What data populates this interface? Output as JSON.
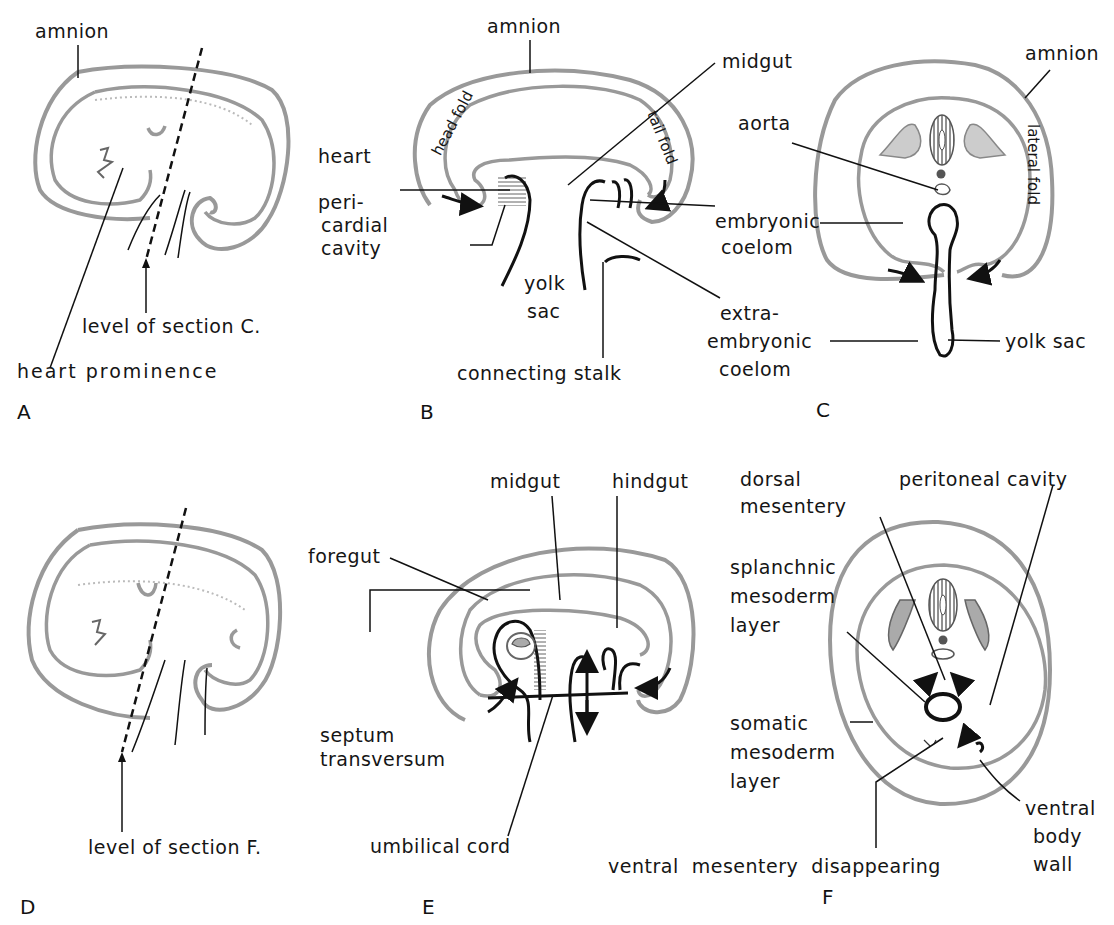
{
  "figure": {
    "panels": [
      {
        "id": "A",
        "label": "A",
        "labels": {
          "amnion": "amnion",
          "level": "level of section C.",
          "heart_prominence": "heart prominence"
        }
      },
      {
        "id": "B",
        "label": "B",
        "labels": {
          "amnion": "amnion",
          "midgut": "midgut",
          "head_fold": "head fold",
          "tail_fold": "tail fold",
          "heart": "heart",
          "pericardial_1": "peri-",
          "pericardial_2": "cardial",
          "pericardial_3": "cavity",
          "yolk_1": "yolk",
          "yolk_2": "sac",
          "connecting_stalk": "connecting stalk"
        }
      },
      {
        "id": "C",
        "label": "C",
        "labels": {
          "amnion": "amnion",
          "aorta": "aorta",
          "lateral_fold": "lateral fold",
          "embryonic_1": "embryonic",
          "embryonic_2": "coelom",
          "extra_1": "extra-",
          "extra_2": "embryonic",
          "extra_3": "coelom",
          "yolk_sac": "yolk sac"
        }
      },
      {
        "id": "D",
        "label": "D",
        "labels": {
          "level": "level of section F."
        }
      },
      {
        "id": "E",
        "label": "E",
        "labels": {
          "midgut": "midgut",
          "hindgut": "hindgut",
          "foregut": "foregut",
          "septum_1": "septum",
          "septum_2": "transversum",
          "umbilical_cord": "umbilical cord"
        }
      },
      {
        "id": "F",
        "label": "F",
        "labels": {
          "dorsal_1": "dorsal",
          "dorsal_2": "mesentery",
          "peritoneal": "peritoneal  cavity",
          "splanchnic_1": "splanchnic",
          "splanchnic_2": "mesoderm",
          "splanchnic_3": "layer",
          "somatic_1": "somatic",
          "somatic_2": "mesoderm",
          "somatic_3": "layer",
          "ventral_mesentery": "ventral  mesentery  disappearing",
          "ventral_body_1": "ventral",
          "ventral_body_2": "body",
          "ventral_body_3": "wall"
        }
      }
    ],
    "colors": {
      "membrane": "#999999",
      "ink": "#111111",
      "shading": "#c8c8c8"
    }
  }
}
